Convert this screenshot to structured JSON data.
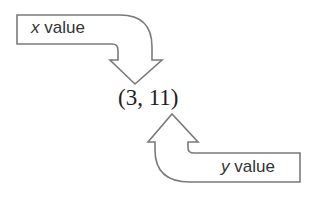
{
  "diagram": {
    "point": "(3, 11)",
    "x_label": {
      "var": "x",
      "text": " value"
    },
    "y_label": {
      "var": "y",
      "text": " value"
    },
    "colors": {
      "stroke": "#7a7a7a",
      "text": "#333333",
      "background": "#ffffff"
    }
  }
}
